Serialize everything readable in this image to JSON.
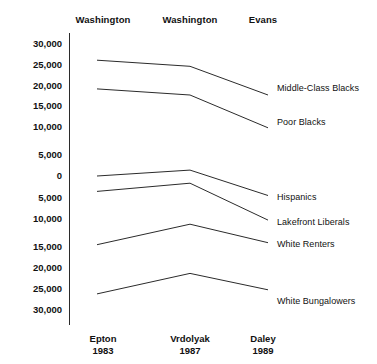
{
  "chart_data": {
    "type": "line",
    "title": "",
    "subtitle": "",
    "xlabel": "",
    "ylabel": "",
    "grid": false,
    "legend_position": "right-inline",
    "categories": [
      "Epton 1983",
      "Vrdolyak 1987",
      "Daley 1989"
    ],
    "x_tick_labels": [
      {
        "name": "Epton",
        "year": "1983"
      },
      {
        "name": "Vrdolyak",
        "year": "1987"
      },
      {
        "name": "Daley",
        "year": "1989"
      }
    ],
    "column_headers": [
      "Washington",
      "Washington",
      "Evans"
    ],
    "y_tick_labels": [
      "30,000",
      "25,000",
      "20,000",
      "15,000",
      "10,000",
      "5,000",
      "0",
      "5,000",
      "10,000",
      "15,000",
      "20,000",
      "25,000",
      "30,000"
    ],
    "y_tick_values": [
      30000,
      25000,
      20000,
      15000,
      10000,
      5000,
      0,
      -5000,
      -10000,
      -15000,
      -20000,
      -25000,
      -30000
    ],
    "ylim": [
      -32000,
      32000
    ],
    "series": [
      {
        "name": "Middle-Class Blacks",
        "values": [
          28000,
          26500,
          19500
        ]
      },
      {
        "name": "Poor  Blacks",
        "values": [
          21000,
          19500,
          11500
        ]
      },
      {
        "name": "Hispanics",
        "values": [
          -250,
          1200,
          -5000
        ]
      },
      {
        "name": "Lakefront Liberals",
        "values": [
          -4000,
          -2000,
          -11000
        ]
      },
      {
        "name": "White Renters",
        "values": [
          -17000,
          -12000,
          -16500
        ]
      },
      {
        "name": "White Bungalowers",
        "values": [
          -29000,
          -24000,
          -28000
        ]
      }
    ],
    "line_color": "#2b2b2b",
    "text_color": "#111111"
  }
}
